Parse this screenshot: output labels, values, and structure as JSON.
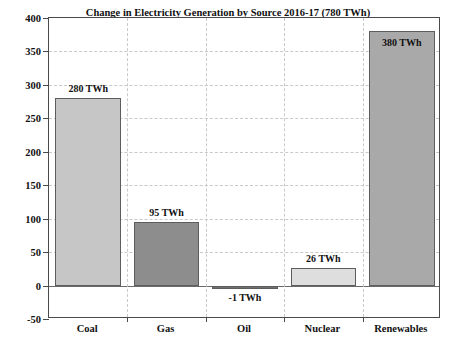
{
  "chart_data": {
    "type": "bar",
    "title": "Change in Electricity Generation by Source 2016-17 (780 TWh)",
    "xlabel": "",
    "ylabel": "Change in Electricity Generation (TWh)",
    "categories": [
      "Coal",
      "Gas",
      "Oil",
      "Nuclear",
      "Renewables"
    ],
    "values": [
      280,
      95,
      -1,
      26,
      380
    ],
    "data_labels": [
      "280 TWh",
      "95 TWh",
      "-1 TWh",
      "26 TWh",
      "380 TWh"
    ],
    "bar_colors": [
      "#c6c6c6",
      "#8d8d8d",
      "#6f6f6f",
      "#dedede",
      "#a9a9a9"
    ],
    "bar_edge_color": "#5d5d5d",
    "ylim": [
      -50,
      400
    ],
    "ytick_values": [
      -50,
      0,
      50,
      100,
      150,
      200,
      250,
      300,
      350,
      400
    ],
    "ytick_labels": [
      "-50",
      "0",
      "50",
      "100",
      "150",
      "200",
      "250",
      "300",
      "350",
      "400"
    ],
    "grid": true,
    "grid_color": "#c9c9c9",
    "legend": "none",
    "zero_line": 0
  },
  "axes": {
    "y_title": "Change in Electricity Generation (TWh)",
    "frame_color": "#4a4a4a"
  }
}
